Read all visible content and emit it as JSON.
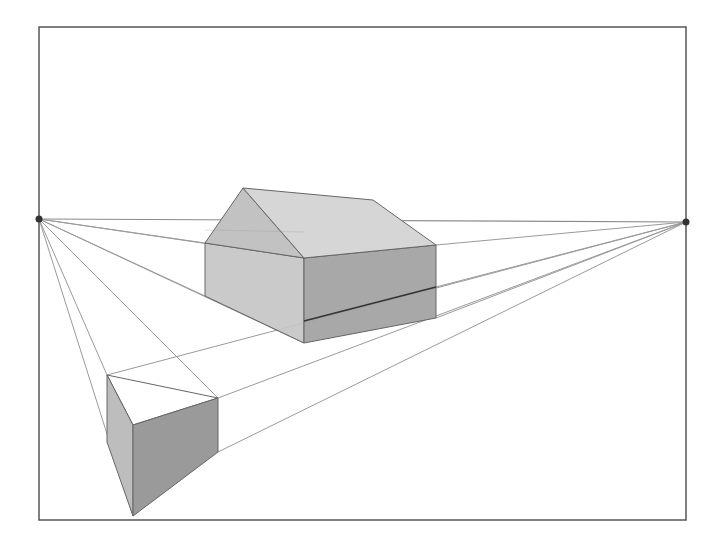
{
  "colors": {
    "background": "#ffffff",
    "frame": "#555555",
    "horizon": "#8a8a8a",
    "construction": "#9a9a9a",
    "edge": "#666666",
    "vanishing_point": "#333333",
    "house_roof": "#d6d6d6",
    "house_gable": "#c2c2c2",
    "house_left_wall": "#c5c5c5",
    "house_right_wall": "#a3a3a3",
    "box_left_face": "#bdbdbd",
    "box_front_face": "#9a9a9a",
    "box_top": "#ffffff",
    "ground_line": "#333333"
  },
  "frame": {
    "x1": 39,
    "y1": 27,
    "x2": 686,
    "y2": 520
  },
  "vanishing_points": {
    "left": {
      "label": "vanishing-point-left",
      "x": 39,
      "y": 219
    },
    "right": {
      "label": "vanishing-point-right",
      "x": 686,
      "y": 222
    }
  },
  "house": {
    "roof_apex": [
      243,
      188
    ],
    "ridge_back": [
      373,
      200
    ],
    "eave_left": [
      205,
      243
    ],
    "front_corner_top": [
      304,
      258
    ],
    "eave_right": [
      436,
      245
    ],
    "left_bottom": [
      205,
      296
    ],
    "front_corner_bottom": [
      304,
      343
    ],
    "right_bottom": [
      436,
      318
    ],
    "ground_line_start": [
      304,
      321
    ],
    "ground_line_end": [
      436,
      287
    ]
  },
  "box": {
    "top_left": [
      107,
      375
    ],
    "top_front": [
      133,
      425
    ],
    "top_right": [
      218,
      398
    ],
    "left_bottom": [
      107,
      442
    ],
    "front_bottom": [
      133,
      516
    ],
    "right_bottom": [
      218,
      452
    ]
  },
  "construction_lines_left": [
    [
      205,
      243
    ],
    [
      304,
      258
    ],
    [
      205,
      296
    ],
    [
      304,
      343
    ],
    [
      218,
      398
    ],
    [
      133,
      516
    ],
    [
      107,
      375
    ]
  ],
  "construction_lines_right": [
    [
      436,
      245
    ],
    [
      436,
      318
    ],
    [
      107,
      375
    ],
    [
      218,
      398
    ],
    [
      218,
      452
    ],
    [
      436,
      287
    ]
  ]
}
